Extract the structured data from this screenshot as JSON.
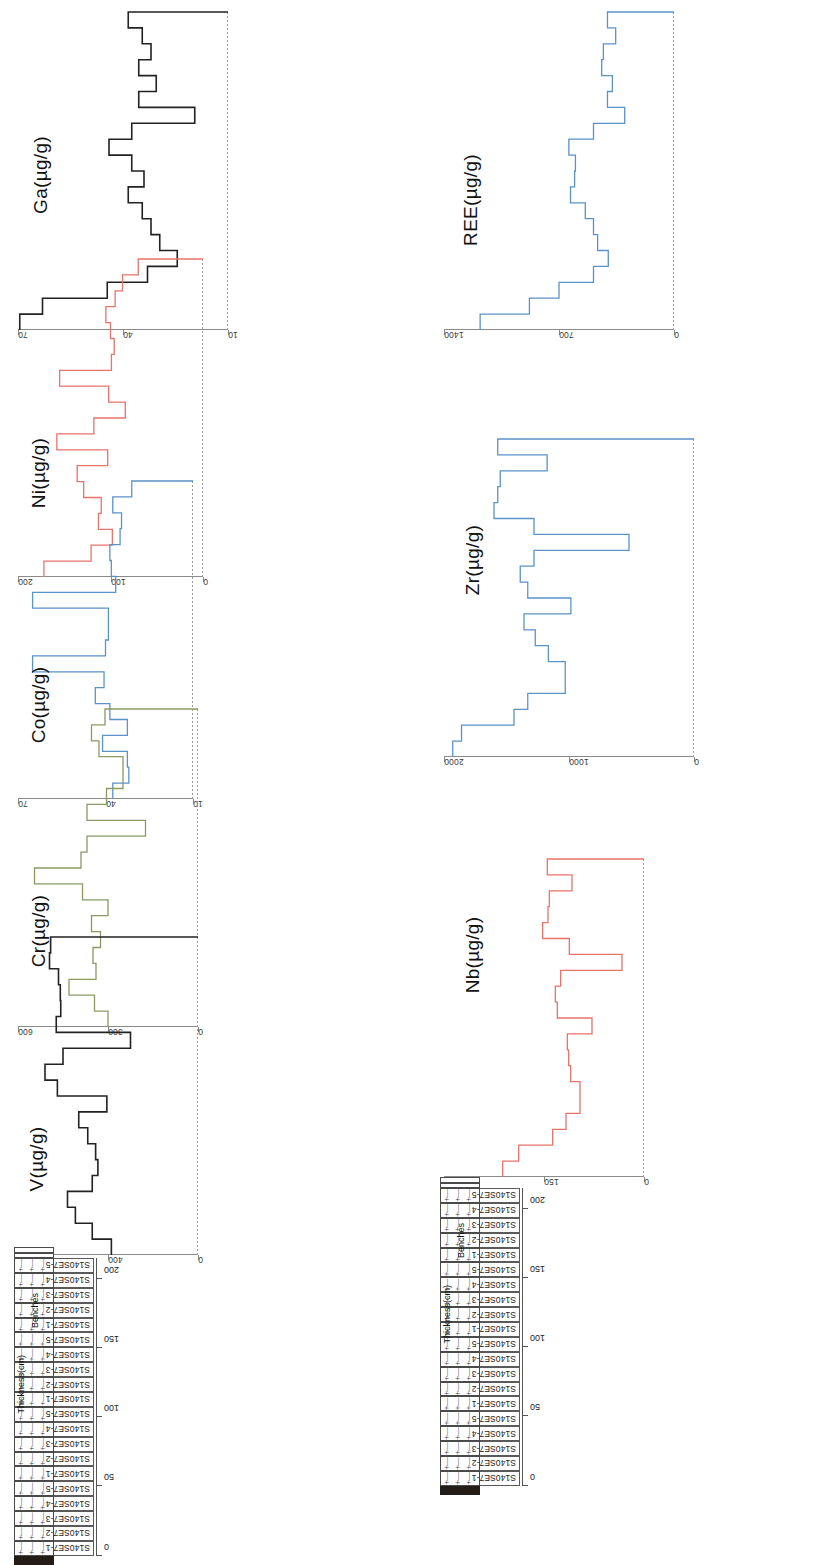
{
  "figure": {
    "orientation": "rotated-90",
    "strat_header_thickness": "Thickness(cm)",
    "strat_header_benches": "Benches"
  },
  "samples": [
    "S140SE7-1",
    "S140SE7-2",
    "S140SE7-3",
    "S140SE7-4",
    "S140SE7-5",
    "S140SE7-1",
    "S140SE7-2",
    "S140SE7-3",
    "S140SE7-4",
    "S140SE7-5",
    "S140SE7-1",
    "S140SE7-2",
    "S140SE7-3",
    "S140SE7-4",
    "S140SE7-5",
    "S140SE7-1",
    "S140SE7-2",
    "S140SE7-3",
    "S140SE7-4",
    "S140SE7-5"
  ],
  "depth_axis": {
    "label": "Thickness(cm)",
    "ticks": [
      0,
      50,
      100,
      150,
      200
    ],
    "range": [
      0,
      215
    ],
    "unit": "cm"
  },
  "colors": {
    "black": "#222222",
    "red": "#e8736a",
    "blue": "#5b93c9",
    "green": "#8a9a62",
    "axis": "#8a8a8a"
  },
  "chart_data": [
    {
      "type": "line",
      "step": "post",
      "id": "ga",
      "title": "",
      "ylabel": "Ga(µg/g)",
      "xlabel": "Thickness(cm)",
      "ylim": [
        10,
        70
      ],
      "yticks": [
        10,
        40,
        70
      ],
      "color": "#222222",
      "x": [
        0,
        11,
        22,
        33,
        44,
        55,
        66,
        77,
        88,
        99,
        110,
        121,
        132,
        143,
        154,
        165,
        176,
        187,
        198,
        209
      ],
      "categories": [
        "S140SE7-1",
        "S140SE7-2",
        "S140SE7-3",
        "S140SE7-4",
        "S140SE7-5",
        "S140SE7-1",
        "S140SE7-2",
        "S140SE7-3",
        "S140SE7-4",
        "S140SE7-5",
        "S140SE7-1",
        "S140SE7-2",
        "S140SE7-3",
        "S140SE7-4",
        "S140SE7-5",
        "S140SE7-1",
        "S140SE7-2",
        "S140SE7-3",
        "S140SE7-4",
        "S140SE7-5"
      ],
      "values": [
        69.5,
        63.0,
        44.5,
        33.0,
        24.5,
        29.5,
        32.0,
        34.5,
        38.5,
        34.0,
        37.5,
        44.0,
        37.5,
        19.5,
        35.5,
        30.5,
        35.5,
        32.0,
        34.5,
        38.5
      ]
    },
    {
      "type": "line",
      "step": "post",
      "id": "ni",
      "title": "",
      "ylabel": "Ni(µg/g)",
      "xlabel": "Thickness(cm)",
      "ylim": [
        0,
        200
      ],
      "yticks": [
        0,
        100,
        200
      ],
      "color": "#e8736a",
      "x": [
        0,
        11,
        22,
        33,
        44,
        55,
        66,
        77,
        88,
        99,
        110,
        121,
        132,
        143,
        154,
        165,
        176,
        187,
        198,
        209
      ],
      "categories": [
        "S140SE7-1",
        "S140SE7-2",
        "S140SE7-3",
        "S140SE7-4",
        "S140SE7-5",
        "S140SE7-1",
        "S140SE7-2",
        "S140SE7-3",
        "S140SE7-4",
        "S140SE7-5",
        "S140SE7-1",
        "S140SE7-2",
        "S140SE7-3",
        "S140SE7-4",
        "S140SE7-5",
        "S140SE7-1",
        "S140SE7-2",
        "S140SE7-3",
        "S140SE7-4",
        "S140SE7-5"
      ],
      "values": [
        172,
        121,
        98,
        113,
        110,
        129,
        136,
        103,
        158,
        118,
        84,
        102,
        155,
        99,
        96,
        100,
        105,
        95,
        87,
        70
      ]
    },
    {
      "type": "line",
      "step": "post",
      "id": "co",
      "title": "",
      "ylabel": "Co(µg/g)",
      "xlabel": "Thickness(cm)",
      "ylim": [
        10,
        70
      ],
      "yticks": [
        10,
        40,
        70
      ],
      "color": "#5b93c9",
      "x": [
        0,
        11,
        22,
        33,
        44,
        55,
        66,
        77,
        88,
        99,
        110,
        121,
        132,
        143,
        154,
        165,
        176,
        187,
        198,
        209
      ],
      "categories": [
        "S140SE7-1",
        "S140SE7-2",
        "S140SE7-3",
        "S140SE7-4",
        "S140SE7-5",
        "S140SE7-1",
        "S140SE7-2",
        "S140SE7-3",
        "S140SE7-4",
        "S140SE7-5",
        "S140SE7-1",
        "S140SE7-2",
        "S140SE7-3",
        "S140SE7-4",
        "S140SE7-5",
        "S140SE7-1",
        "S140SE7-2",
        "S140SE7-3",
        "S140SE7-4",
        "S140SE7-5"
      ],
      "values": [
        37.5,
        32.0,
        32.5,
        41.0,
        32.5,
        38.5,
        43.5,
        40.5,
        65.0,
        40.0,
        39.0,
        39.0,
        65.0,
        36.5,
        38.0,
        38.5,
        35.0,
        34.5,
        37.5,
        31.0
      ]
    },
    {
      "type": "line",
      "step": "post",
      "id": "cr",
      "title": "",
      "ylabel": "Cr(µg/g)",
      "xlabel": "Thickness(cm)",
      "ylim": [
        0,
        600
      ],
      "yticks": [
        0,
        300,
        600
      ],
      "color": "#8a9a62",
      "x": [
        0,
        11,
        22,
        33,
        44,
        55,
        66,
        77,
        88,
        99,
        110,
        121,
        132,
        143,
        154,
        165,
        176,
        187,
        198,
        209
      ],
      "categories": [
        "S140SE7-1",
        "S140SE7-2",
        "S140SE7-3",
        "S140SE7-4",
        "S140SE7-5",
        "S140SE7-1",
        "S140SE7-2",
        "S140SE7-3",
        "S140SE7-4",
        "S140SE7-5",
        "S140SE7-1",
        "S140SE7-2",
        "S140SE7-3",
        "S140SE7-4",
        "S140SE7-5",
        "S140SE7-1",
        "S140SE7-2",
        "S140SE7-3",
        "S140SE7-4",
        "S140SE7-5"
      ],
      "values": [
        300,
        345,
        430,
        340,
        350,
        325,
        355,
        300,
        385,
        545,
        390,
        370,
        175,
        370,
        305,
        250,
        250,
        330,
        355,
        310
      ]
    },
    {
      "type": "line",
      "step": "post",
      "id": "v",
      "title": "",
      "ylabel": "V(µg/g)",
      "xlabel": "Thickness(cm)",
      "ylim": [
        0,
        800
      ],
      "yticks": [
        0,
        400,
        800
      ],
      "color": "#222222",
      "x": [
        0,
        11,
        22,
        33,
        44,
        55,
        66,
        77,
        88,
        99,
        110,
        121,
        132,
        143,
        154,
        165,
        176,
        187,
        198,
        209
      ],
      "categories": [
        "S140SE7-1",
        "S140SE7-2",
        "S140SE7-3",
        "S140SE7-4",
        "S140SE7-5",
        "S140SE7-1",
        "S140SE7-2",
        "S140SE7-3",
        "S140SE7-4",
        "S140SE7-5",
        "S140SE7-1",
        "S140SE7-2",
        "S140SE7-3",
        "S140SE7-4",
        "S140SE7-5",
        "S140SE7-1",
        "S140SE7-2",
        "S140SE7-3",
        "S140SE7-4",
        "S140SE7-5"
      ],
      "values": [
        385,
        470,
        545,
        580,
        470,
        445,
        455,
        490,
        530,
        405,
        625,
        680,
        600,
        300,
        630,
        610,
        612,
        620,
        660,
        655
      ]
    },
    {
      "type": "line",
      "step": "post",
      "id": "ree",
      "title": "",
      "ylabel": "REE(µg/g)",
      "xlabel": "Thickness(cm)",
      "ylim": [
        0,
        1400
      ],
      "yticks": [
        0,
        700,
        1400
      ],
      "color": "#5b93c9",
      "x": [
        0,
        11,
        22,
        33,
        44,
        55,
        66,
        77,
        88,
        99,
        110,
        121,
        132,
        143,
        154,
        165,
        176,
        187,
        198,
        209
      ],
      "categories": [
        "S140SE7-1",
        "S140SE7-2",
        "S140SE7-3",
        "S140SE7-4",
        "S140SE7-5",
        "S140SE7-1",
        "S140SE7-2",
        "S140SE7-3",
        "S140SE7-4",
        "S140SE7-5",
        "S140SE7-1",
        "S140SE7-2",
        "S140SE7-3",
        "S140SE7-4",
        "S140SE7-5",
        "S140SE7-1",
        "S140SE7-2",
        "S140SE7-3",
        "S140SE7-4",
        "S140SE7-5"
      ],
      "values": [
        1180,
        880,
        700,
        490,
        400,
        465,
        490,
        540,
        630,
        605,
        600,
        640,
        490,
        300,
        405,
        375,
        440,
        430,
        355,
        405
      ]
    },
    {
      "type": "line",
      "step": "post",
      "id": "zr",
      "title": "",
      "ylabel": "Zr(µg/g)",
      "xlabel": "Thickness(cm)",
      "ylim": [
        0,
        2000
      ],
      "yticks": [
        0,
        1000,
        2000
      ],
      "color": "#5b93c9",
      "x": [
        0,
        11,
        22,
        33,
        44,
        55,
        66,
        77,
        88,
        99,
        110,
        121,
        132,
        143,
        154,
        165,
        176,
        187,
        198,
        209
      ],
      "categories": [
        "S140SE7-1",
        "S140SE7-2",
        "S140SE7-3",
        "S140SE7-4",
        "S140SE7-5",
        "S140SE7-1",
        "S140SE7-2",
        "S140SE7-3",
        "S140SE7-4",
        "S140SE7-5",
        "S140SE7-1",
        "S140SE7-2",
        "S140SE7-3",
        "S140SE7-4",
        "S140SE7-5",
        "S140SE7-1",
        "S140SE7-2",
        "S140SE7-3",
        "S140SE7-4",
        "S140SE7-5"
      ],
      "values": [
        1930,
        1860,
        1440,
        1330,
        1030,
        1030,
        1165,
        1270,
        1360,
        985,
        1330,
        1390,
        1280,
        520,
        1280,
        1600,
        1570,
        1550,
        1175,
        1570
      ]
    },
    {
      "type": "line",
      "step": "post",
      "id": "nb",
      "title": "",
      "ylabel": "Nb(µg/g)",
      "xlabel": "Thickness(cm)",
      "ylim": [
        0,
        300
      ],
      "yticks": [
        0,
        150,
        300
      ],
      "color": "#e8736a",
      "x": [
        0,
        11,
        22,
        33,
        44,
        55,
        66,
        77,
        88,
        99,
        110,
        121,
        132,
        143,
        154,
        165,
        176,
        187,
        198,
        209
      ],
      "categories": [
        "S140SE7-1",
        "S140SE7-2",
        "S140SE7-3",
        "S140SE7-4",
        "S140SE7-5",
        "S140SE7-1",
        "S140SE7-2",
        "S140SE7-3",
        "S140SE7-4",
        "S140SE7-5",
        "S140SE7-1",
        "S140SE7-2",
        "S140SE7-3",
        "S140SE7-4",
        "S140SE7-5",
        "S140SE7-1",
        "S140SE7-2",
        "S140SE7-3",
        "S140SE7-4",
        "S140SE7-5"
      ],
      "values": [
        212,
        188,
        137,
        117,
        96,
        96,
        110,
        113,
        115,
        78,
        130,
        133,
        125,
        33,
        112,
        152,
        144,
        142,
        108,
        145
      ]
    }
  ],
  "panel_layout": {
    "left_column": [
      "ga",
      "ni",
      "co",
      "cr",
      "v"
    ],
    "right_column": [
      "ree",
      "zr",
      "nb"
    ]
  }
}
